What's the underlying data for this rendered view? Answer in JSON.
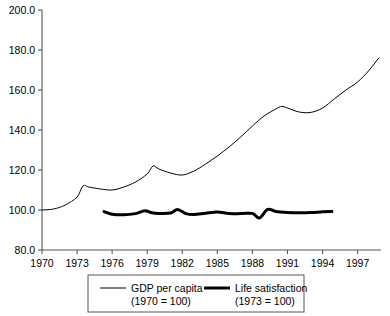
{
  "chart_data": {
    "type": "line",
    "title": "",
    "subtitle": "",
    "xlabel": "",
    "ylabel": "",
    "xlim": [
      1970,
      1999
    ],
    "ylim": [
      80.0,
      200.0
    ],
    "grid": false,
    "legend_position": "bottom",
    "y_ticks": [
      "80.0",
      "100.0",
      "120.0",
      "140.0",
      "160.0",
      "180.0",
      "200.0"
    ],
    "y_tick_values": [
      80,
      100,
      120,
      140,
      160,
      180,
      200
    ],
    "x_ticks": [
      "1970",
      "1973",
      "1976",
      "1979",
      "1982",
      "1985",
      "1988",
      "1991",
      "1994",
      "1997"
    ],
    "x_tick_values": [
      1970,
      1973,
      1976,
      1979,
      1982,
      1985,
      1988,
      1991,
      1994,
      1997
    ],
    "series": [
      {
        "name": "GDP per capita",
        "base_note": "(1970 = 100)",
        "style": "thin",
        "color": "#000000",
        "line_width": 1,
        "x": [
          1970,
          1971,
          1972,
          1973,
          1973.5,
          1974,
          1975,
          1976,
          1977,
          1978,
          1979,
          1979.5,
          1980,
          1981,
          1982,
          1983,
          1984,
          1985,
          1986,
          1987,
          1988,
          1989,
          1990,
          1990.5,
          1991,
          1992,
          1993,
          1994,
          1995,
          1996,
          1997,
          1998,
          1998.8
        ],
        "y": [
          100.0,
          100.5,
          102.5,
          106.5,
          112.0,
          111.5,
          110.5,
          110.0,
          111.5,
          114.0,
          118.0,
          122.0,
          120.5,
          118.5,
          117.5,
          119.5,
          123.0,
          127.0,
          131.5,
          136.5,
          142.0,
          147.0,
          150.5,
          151.8,
          151.0,
          149.0,
          148.8,
          151.0,
          155.5,
          160.0,
          164.0,
          170.0,
          176.0
        ]
      },
      {
        "name": "Life satisfaction",
        "base_note": "(1973 = 100)",
        "style": "thick",
        "color": "#000000",
        "line_width": 3,
        "x": [
          1975.3,
          1976,
          1977,
          1978,
          1978.8,
          1979.4,
          1980,
          1981,
          1981.6,
          1982.3,
          1983,
          1984,
          1985,
          1986,
          1987,
          1988,
          1988.6,
          1989.3,
          1990,
          1991,
          1992,
          1993,
          1994,
          1994.8
        ],
        "y": [
          99.2,
          97.9,
          97.6,
          98.2,
          99.6,
          98.6,
          98.3,
          98.5,
          100.3,
          98.2,
          97.7,
          98.4,
          99.0,
          98.2,
          98.2,
          98.3,
          96.0,
          100.3,
          99.3,
          98.8,
          98.6,
          98.7,
          99.1,
          99.2
        ]
      }
    ]
  },
  "legend": {
    "entries": [
      {
        "label": "GDP per capita",
        "sublabel": "(1970 = 100)",
        "style": "thin"
      },
      {
        "label": "Life satisfaction",
        "sublabel": "(1973 = 100)",
        "style": "thick"
      }
    ]
  }
}
